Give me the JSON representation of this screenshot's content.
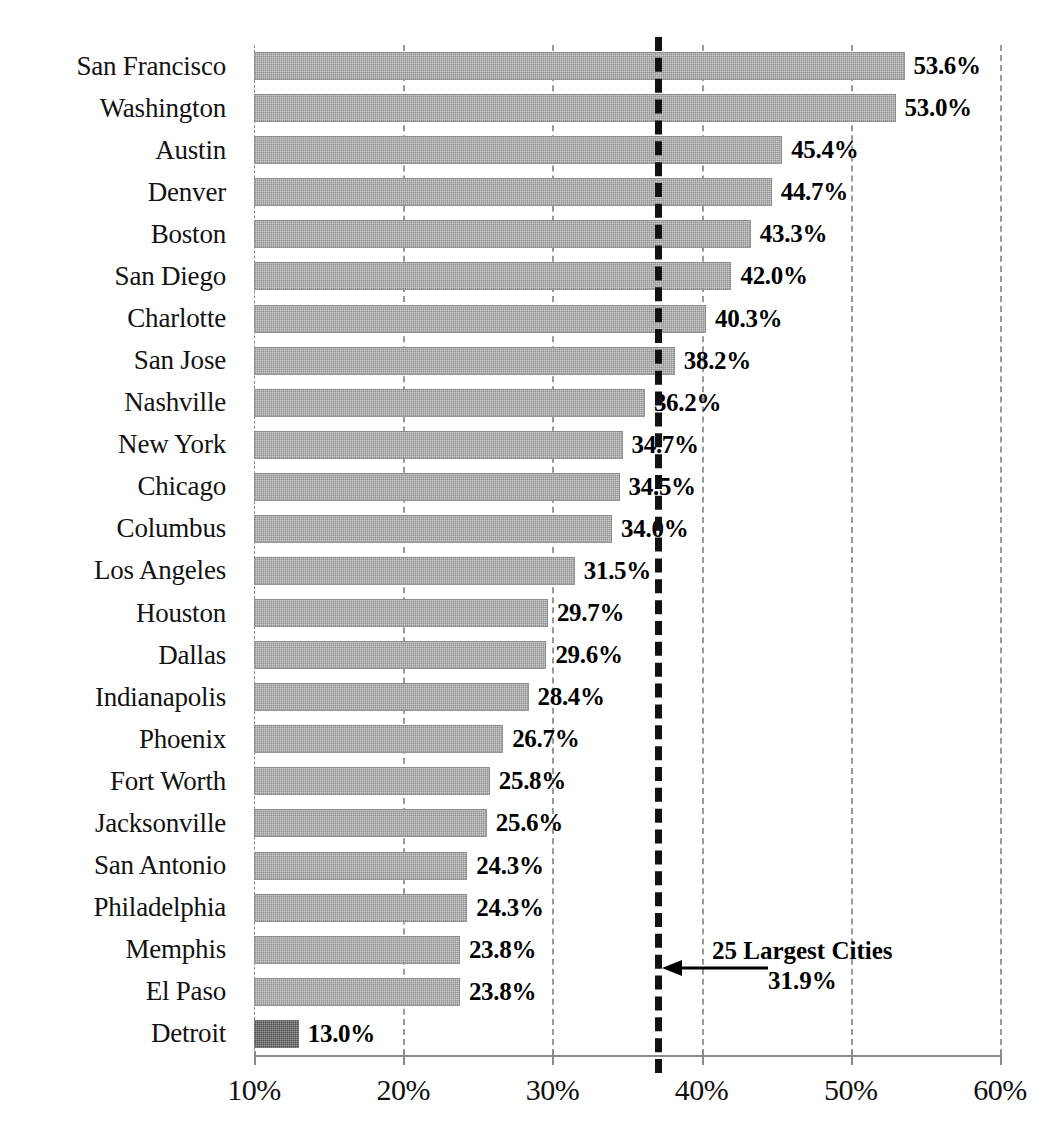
{
  "chart_data": {
    "type": "bar",
    "orientation": "horizontal",
    "title": "",
    "xlabel": "",
    "ylabel": "",
    "xlim": [
      10,
      60
    ],
    "grid": true,
    "legend": "none",
    "xticks": [
      "10%",
      "20%",
      "30%",
      "40%",
      "50%",
      "60%"
    ],
    "xtick_values": [
      10,
      20,
      30,
      40,
      50,
      60
    ],
    "categories": [
      "San Francisco",
      "Washington",
      "Austin",
      "Denver",
      "Boston",
      "San Diego",
      "Charlotte",
      "San Jose",
      "Nashville",
      "New York",
      "Chicago",
      "Columbus",
      "Los Angeles",
      "Houston",
      "Dallas",
      "Indianapolis",
      "Phoenix",
      "Fort Worth",
      "Jacksonville",
      "San Antonio",
      "Philadelphia",
      "Memphis",
      "El Paso",
      "Detroit"
    ],
    "values": [
      53.6,
      53.0,
      45.4,
      44.7,
      43.3,
      42.0,
      40.3,
      38.2,
      36.2,
      34.7,
      34.5,
      34.0,
      31.5,
      29.7,
      29.6,
      28.4,
      26.7,
      25.8,
      25.6,
      24.3,
      24.3,
      23.8,
      23.8,
      13.0
    ],
    "labels": [
      "53.6%",
      "53.0%",
      "45.4%",
      "44.7%",
      "43.3%",
      "42.0%",
      "40.3%",
      "38.2%",
      "36.2%",
      "34.7%",
      "34.5%",
      "34.0%",
      "31.5%",
      "29.7%",
      "29.6%",
      "28.4%",
      "26.7%",
      "25.8%",
      "25.6%",
      "24.3%",
      "24.3%",
      "23.8%",
      "23.8%",
      "13.0%"
    ],
    "highlight_index": 23,
    "reference_line": {
      "value": 36.9,
      "style": "thick-dashed",
      "color": "#111111"
    },
    "annotation": {
      "line1": "25 Largest Cities",
      "line2": "31.9%",
      "arrow": "left-arrow"
    },
    "colors": {
      "bar": "#8f8f8f",
      "bar_highlight": "#4e4e4e",
      "grid": "#9a9a9a",
      "axis": "#8a8a8a",
      "reference_line": "#111111",
      "text": "#121212"
    }
  },
  "caption": {
    "text": ""
  }
}
